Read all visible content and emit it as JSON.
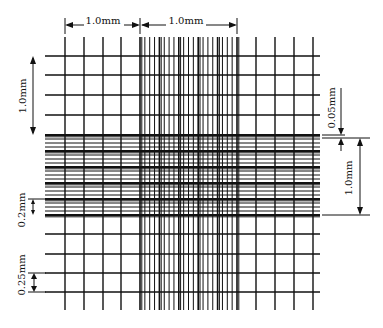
{
  "colors": {
    "line": "#111111",
    "background": "#ffffff"
  },
  "labels": {
    "top_left_width": "1.0mm",
    "top_center_width": "1.0mm",
    "left_height": "1.0mm",
    "left_small": "0.2mm",
    "left_bottom": "0.25mm",
    "right_small": "0.05mm",
    "right_height": "1.0mm"
  },
  "grid": {
    "outer_left_x": [
      65,
      84,
      103,
      121
    ],
    "outer_right_x": [
      256,
      275,
      294,
      313
    ],
    "center_x_start": 140,
    "center_x_end": 237,
    "outer_top_y": [
      56,
      75,
      95,
      115
    ],
    "outer_bottom_y": [
      234,
      254,
      273,
      292
    ],
    "center_y_start": 135,
    "center_y_end": 215,
    "grid_left": 45,
    "grid_right": 320,
    "grid_top": 37,
    "grid_bottom": 310,
    "center_groups": 5,
    "lines_per_group": 4
  }
}
